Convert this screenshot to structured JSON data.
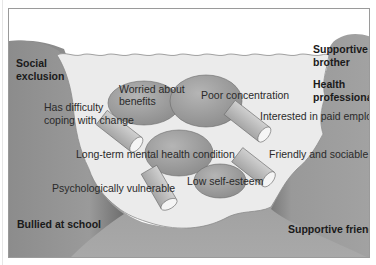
{
  "diagram": {
    "type": "river-metaphor",
    "banks": {
      "left": [
        "Social exclusion",
        "Bullied at school"
      ],
      "right": [
        "Supportive brother",
        "Health professionals",
        "Supportive friends"
      ]
    },
    "rocks": {
      "worried": "Worried about benefits",
      "worried_l1": "Worried about",
      "worried_l2": "benefits",
      "concentration": "Poor concentration",
      "mental": "Long-term mental health condition",
      "esteem": "Low self-esteem"
    },
    "logs": {
      "coping_l1": "Has difficulty",
      "coping_l2": "coping with change",
      "employment": "Interested in paid employment",
      "friendly": "Friendly and sociable",
      "vulnerable": "Psychologically vulnerable"
    },
    "labels": {
      "social_l1": "Social",
      "social_l2": "exclusion",
      "brother_l1": "Supportive",
      "brother_l2": "brother",
      "health_l1": "Health",
      "health_l2": "professionals",
      "bullied": "Bullied at school",
      "friends": "Supportive friends"
    },
    "colors": {
      "bank": "#8f8f8f",
      "water": "#ebebeb",
      "rock": "#9c9c9c",
      "log": "#b8b8b8",
      "frame": "#9a9a9a"
    }
  }
}
